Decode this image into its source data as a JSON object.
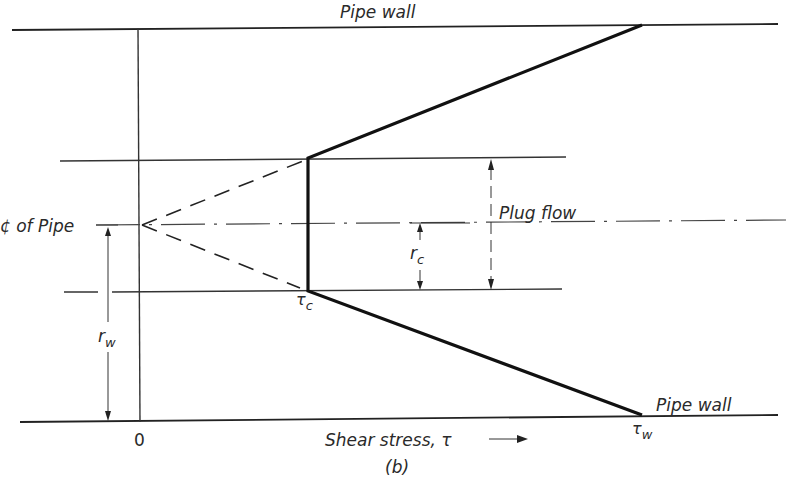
{
  "figure": {
    "caption": "(b)"
  },
  "labels": {
    "top_wall": "Pipe wall",
    "bottom_wall": "Pipe wall",
    "centerline": "¢ of Pipe",
    "plug_flow": "Plug flow",
    "r_c": "r",
    "r_c_sub": "c",
    "r_w": "r",
    "r_w_sub": "w",
    "tau_c": "τ",
    "tau_c_sub": "c",
    "tau_w": "τ",
    "tau_w_sub": "w",
    "origin": "0",
    "x_axis": "Shear stress, τ —→",
    "x_axis_text": "Shear stress, τ",
    "x_axis_arrow": "⟶"
  },
  "geometry": {
    "top_wall_y": 30,
    "bottom_wall_y": 421,
    "centerline_y": 225,
    "plug_top_y": 159,
    "plug_bottom_y": 291,
    "axis_x": 138,
    "tau_c_x": 308,
    "tau_w_x": 642
  },
  "colors": {
    "ink": "#222222",
    "background": "#ffffff"
  }
}
